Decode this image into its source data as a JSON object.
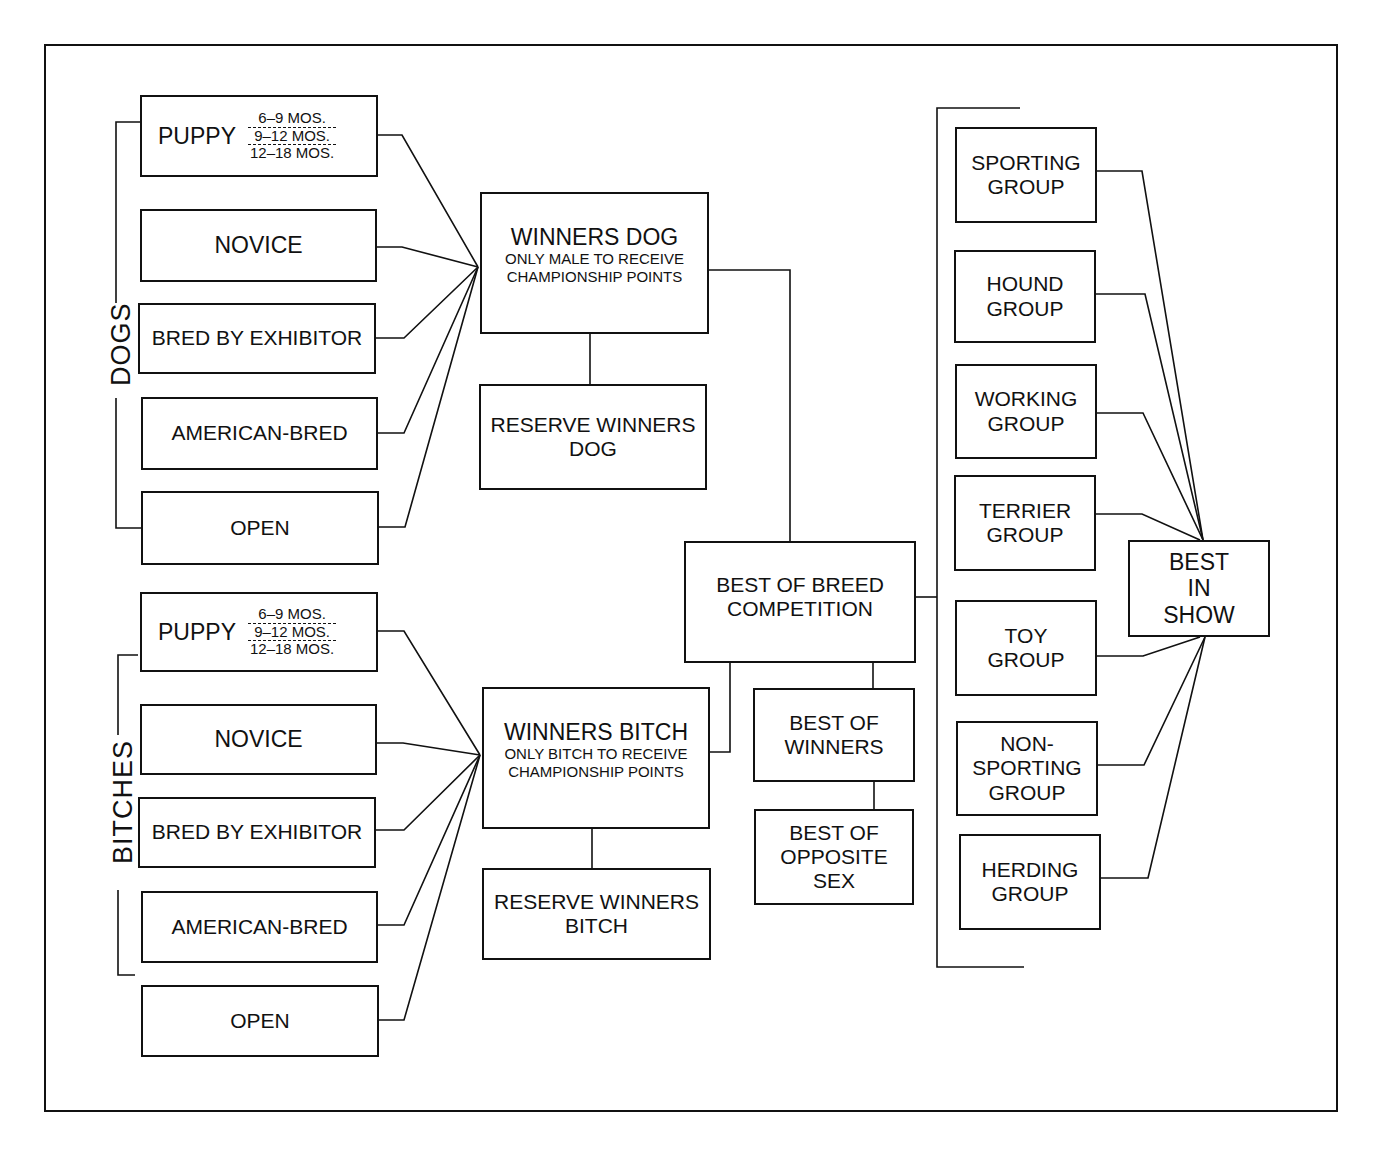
{
  "diagram": {
    "type": "flowchart",
    "sections": {
      "dogs_label": "DOGS",
      "bitches_label": "BITCHES"
    },
    "dogs_classes": [
      {
        "label": "PUPPY",
        "ages": [
          "6–9 MOS.",
          "9–12 MOS.",
          "12–18 MOS."
        ]
      },
      {
        "label": "NOVICE"
      },
      {
        "label": "BRED BY EXHIBITOR"
      },
      {
        "label": "AMERICAN-BRED"
      },
      {
        "label": "OPEN"
      }
    ],
    "bitches_classes": [
      {
        "label": "PUPPY",
        "ages": [
          "6–9 MOS.",
          "9–12 MOS.",
          "12–18 MOS."
        ]
      },
      {
        "label": "NOVICE"
      },
      {
        "label": "BRED BY EXHIBITOR"
      },
      {
        "label": "AMERICAN-BRED"
      },
      {
        "label": "OPEN"
      }
    ],
    "winners_dog": {
      "title": "WINNERS DOG",
      "line1": "ONLY MALE TO RECEIVE",
      "line2": "CHAMPIONSHIP POINTS"
    },
    "reserve_winners_dog": {
      "line1": "RESERVE WINNERS",
      "line2": "DOG"
    },
    "winners_bitch": {
      "title": "WINNERS BITCH",
      "line1": "ONLY BITCH TO RECEIVE",
      "line2": "CHAMPIONSHIP POINTS"
    },
    "reserve_winners_bitch": {
      "line1": "RESERVE WINNERS",
      "line2": "BITCH"
    },
    "best_of_breed": {
      "line1": "BEST OF BREED",
      "line2": "COMPETITION"
    },
    "best_of_winners": {
      "line1": "BEST OF",
      "line2": "WINNERS"
    },
    "best_of_opposite_sex": {
      "line1": "BEST OF",
      "line2": "OPPOSITE",
      "line3": "SEX"
    },
    "groups": [
      {
        "line1": "SPORTING",
        "line2": "GROUP"
      },
      {
        "line1": "HOUND",
        "line2": "GROUP"
      },
      {
        "line1": "WORKING",
        "line2": "GROUP"
      },
      {
        "line1": "TERRIER",
        "line2": "GROUP"
      },
      {
        "line1": "TOY",
        "line2": "GROUP"
      },
      {
        "line1": "NON-",
        "line2": "SPORTING",
        "line3": "GROUP"
      },
      {
        "line1": "HERDING",
        "line2": "GROUP"
      }
    ],
    "best_in_show": {
      "line1": "BEST",
      "line2": "IN",
      "line3": "SHOW"
    },
    "colors": {
      "line": "#111111",
      "background": "#ffffff"
    }
  }
}
